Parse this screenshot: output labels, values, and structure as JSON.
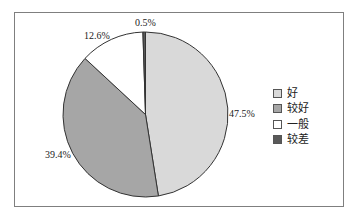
{
  "chart_data": {
    "type": "pie",
    "title": "",
    "categories": [
      "好",
      "较好",
      "一般",
      "较差"
    ],
    "values": [
      47.5,
      39.4,
      12.6,
      0.5
    ],
    "labels": [
      "47.5%",
      "39.4%",
      "12.6%",
      "0.5%"
    ],
    "colors": [
      "#d9d9d9",
      "#a6a6a6",
      "#ffffff",
      "#595959"
    ],
    "start_angle": "12 o'clock, clockwise",
    "legend_position": "right"
  },
  "legend": {
    "items": [
      {
        "label": "好",
        "color": "#d9d9d9"
      },
      {
        "label": "较好",
        "color": "#a6a6a6"
      },
      {
        "label": "一般",
        "color": "#ffffff"
      },
      {
        "label": "较差",
        "color": "#595959"
      }
    ]
  }
}
